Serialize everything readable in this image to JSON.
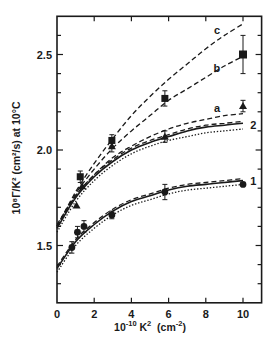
{
  "chart_data": {
    "type": "scatter",
    "title": "",
    "xlabel": "10^-10 K^2 (cm^-2)",
    "ylabel": "10^8 Γ/K^2 (cm^2/s) at 10°C",
    "xlim": [
      0,
      11
    ],
    "ylim": [
      1.2,
      2.7
    ],
    "x_ticks": [
      0,
      2,
      4,
      6,
      8,
      10
    ],
    "x_tick_labels": [
      "0",
      "2",
      "4",
      "6",
      "8",
      "10"
    ],
    "y_ticks": [
      1.5,
      2.0,
      2.5
    ],
    "y_tick_labels": [
      "1.5",
      "2.0",
      "2.5"
    ],
    "y_minor_step": 0.1,
    "grid": false,
    "legend": "none (curves labelled inline: c, b, a, 2, 1)",
    "series": [
      {
        "name": "squares",
        "marker": "square",
        "points": [
          {
            "x": 1.25,
            "y": 1.86,
            "err": 0.03
          },
          {
            "x": 2.95,
            "y": 2.05,
            "err": 0.03
          },
          {
            "x": 5.8,
            "y": 2.27,
            "err": 0.04
          },
          {
            "x": 10.0,
            "y": 2.5,
            "err": 0.1
          }
        ]
      },
      {
        "name": "triangles",
        "marker": "triangle",
        "points": [
          {
            "x": 1.05,
            "y": 1.71,
            "err": 0
          },
          {
            "x": 1.35,
            "y": 1.81,
            "err": 0
          },
          {
            "x": 2.95,
            "y": 2.02,
            "err": 0.03
          },
          {
            "x": 5.8,
            "y": 2.07,
            "err": 0.03
          },
          {
            "x": 10.0,
            "y": 2.23,
            "err": 0.03
          }
        ]
      },
      {
        "name": "circles",
        "marker": "circle",
        "points": [
          {
            "x": 0.8,
            "y": 1.49,
            "err": 0.03
          },
          {
            "x": 1.1,
            "y": 1.57,
            "err": 0.03
          },
          {
            "x": 1.45,
            "y": 1.6,
            "err": 0.03
          },
          {
            "x": 2.95,
            "y": 1.66,
            "err": 0.02
          },
          {
            "x": 5.8,
            "y": 1.78,
            "err": 0.04
          },
          {
            "x": 10.0,
            "y": 1.82,
            "err": 0
          }
        ]
      }
    ],
    "curves": [
      {
        "name": "c",
        "style": "dashed",
        "label": "c",
        "x": [
          0,
          1,
          2,
          3,
          4,
          5,
          6,
          7,
          8,
          9,
          10
        ],
        "y": [
          1.6,
          1.78,
          1.93,
          2.06,
          2.18,
          2.28,
          2.37,
          2.45,
          2.53,
          2.6,
          2.66
        ]
      },
      {
        "name": "b",
        "style": "dashed",
        "label": "b",
        "x": [
          0,
          1,
          2,
          3,
          4,
          5,
          6,
          7,
          8,
          9,
          10
        ],
        "y": [
          1.6,
          1.77,
          1.9,
          2.01,
          2.1,
          2.18,
          2.26,
          2.32,
          2.38,
          2.44,
          2.49
        ]
      },
      {
        "name": "a",
        "style": "dashed",
        "label": "a",
        "x": [
          0,
          1,
          2,
          3,
          4,
          5,
          6,
          7,
          8,
          9,
          10
        ],
        "y": [
          1.6,
          1.76,
          1.87,
          1.96,
          2.02,
          2.07,
          2.11,
          2.14,
          2.16,
          2.18,
          2.19
        ]
      },
      {
        "name": "2-dashed",
        "style": "dashed",
        "label": "",
        "x": [
          0,
          1,
          2,
          3,
          4,
          5,
          6,
          7,
          8,
          9,
          10
        ],
        "y": [
          1.61,
          1.76,
          1.87,
          1.95,
          2.01,
          2.05,
          2.08,
          2.11,
          2.13,
          2.14,
          2.15
        ]
      },
      {
        "name": "2-solid",
        "style": "solid",
        "label": "2",
        "x": [
          0,
          1,
          2,
          3,
          4,
          5,
          6,
          7,
          8,
          9,
          10
        ],
        "y": [
          1.59,
          1.75,
          1.86,
          1.94,
          2.0,
          2.04,
          2.07,
          2.1,
          2.12,
          2.13,
          2.14
        ]
      },
      {
        "name": "2-dotted",
        "style": "dotted",
        "label": "",
        "x": [
          0,
          1,
          2,
          3,
          4,
          5,
          6,
          7,
          8,
          9,
          10
        ],
        "y": [
          1.57,
          1.73,
          1.84,
          1.92,
          1.98,
          2.02,
          2.05,
          2.07,
          2.09,
          2.1,
          2.11
        ]
      },
      {
        "name": "1-dashed",
        "style": "dashed",
        "label": "",
        "x": [
          0,
          1,
          2,
          3,
          4,
          5,
          6,
          7,
          8,
          9,
          10
        ],
        "y": [
          1.39,
          1.53,
          1.62,
          1.69,
          1.74,
          1.77,
          1.8,
          1.82,
          1.83,
          1.84,
          1.85
        ]
      },
      {
        "name": "1-solid",
        "style": "solid",
        "label": "1",
        "x": [
          0,
          1,
          2,
          3,
          4,
          5,
          6,
          7,
          8,
          9,
          10
        ],
        "y": [
          1.38,
          1.52,
          1.61,
          1.68,
          1.73,
          1.76,
          1.79,
          1.81,
          1.82,
          1.83,
          1.84
        ]
      },
      {
        "name": "1-dotted",
        "style": "dotted",
        "label": "",
        "x": [
          0,
          1,
          2,
          3,
          4,
          5,
          6,
          7,
          8,
          9,
          10
        ],
        "y": [
          1.36,
          1.5,
          1.59,
          1.66,
          1.71,
          1.74,
          1.77,
          1.79,
          1.8,
          1.81,
          1.82
        ]
      }
    ],
    "curve_labels": [
      {
        "text": "c",
        "x": 8.6,
        "y": 2.63
      },
      {
        "text": "b",
        "x": 8.6,
        "y": 2.43
      },
      {
        "text": "a",
        "x": 8.6,
        "y": 2.22
      },
      {
        "text": "2",
        "x": 10.55,
        "y": 2.13
      },
      {
        "text": "1",
        "x": 10.55,
        "y": 1.84
      }
    ]
  },
  "labels": {
    "xlabel_main": "10",
    "xlabel_sup": "-10",
    "xlabel_rest": " K",
    "xlabel_sup2": "2",
    "xlabel_unit": "  (cm",
    "xlabel_unit_sup": "-2",
    "xlabel_close": ")",
    "ylabel_text": "10⁸Γ/K² (cm²/s) at 10°C"
  }
}
